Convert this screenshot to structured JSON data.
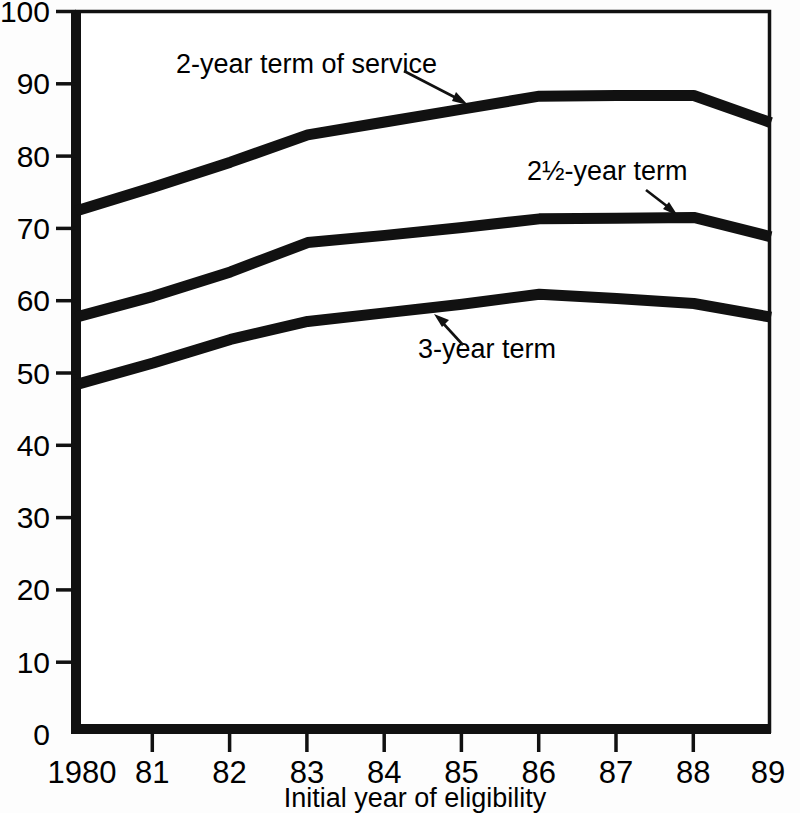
{
  "chart_data": {
    "type": "line",
    "title": "",
    "xlabel": "Initial year of eligibility",
    "ylabel": "",
    "x": [
      1980,
      1981,
      1982,
      1983,
      1984,
      1985,
      1986,
      1987,
      1988,
      1989
    ],
    "x_tick_labels": [
      "1980",
      "81",
      "82",
      "83",
      "84",
      "85",
      "86",
      "87",
      "88",
      "89"
    ],
    "y_tick_labels": [
      "0",
      "10",
      "20",
      "30",
      "40",
      "50",
      "60",
      "70",
      "80",
      "90",
      "100"
    ],
    "y_ticks": [
      0,
      10,
      20,
      30,
      40,
      50,
      60,
      70,
      80,
      90,
      100
    ],
    "ylim": [
      0,
      100
    ],
    "xlim": [
      1980,
      1989
    ],
    "grid": false,
    "legend_position": "inline-annotations",
    "series": [
      {
        "name": "2-year term of service",
        "label": "2-year term of service",
        "values": [
          72.2,
          75.5,
          79.0,
          82.8,
          84.6,
          86.4,
          88.2,
          88.3,
          88.3,
          84.5
        ],
        "color": "#111111"
      },
      {
        "name": "2½-year term",
        "label": "2½-year term",
        "values": [
          57.4,
          60.3,
          63.7,
          67.8,
          68.8,
          69.9,
          71.1,
          71.2,
          71.3,
          68.6
        ],
        "color": "#111111"
      },
      {
        "name": "3-year term",
        "label": "3-year term",
        "values": [
          48.0,
          51.0,
          54.3,
          56.8,
          58.0,
          59.2,
          60.6,
          60.0,
          59.3,
          57.4
        ],
        "color": "#111111"
      }
    ],
    "annotations": [
      {
        "text": "2-year term of service",
        "text_x": 176,
        "text_y": 73,
        "arrow_from_x": 404,
        "arrow_from_y": 71,
        "arrow_to_x": 468,
        "arrow_to_y": 105
      },
      {
        "text": "2½-year term",
        "text_x": 527,
        "text_y": 180,
        "arrow_from_x": 646,
        "arrow_from_y": 190,
        "arrow_to_x": 676,
        "arrow_to_y": 214
      },
      {
        "text": "3-year term",
        "text_x": 418,
        "text_y": 358,
        "arrow_from_x": 463,
        "arrow_from_y": 345,
        "arrow_to_x": 437,
        "arrow_to_y": 317
      }
    ]
  },
  "axes": {
    "x_axis_title": "Initial year of eligibility"
  }
}
